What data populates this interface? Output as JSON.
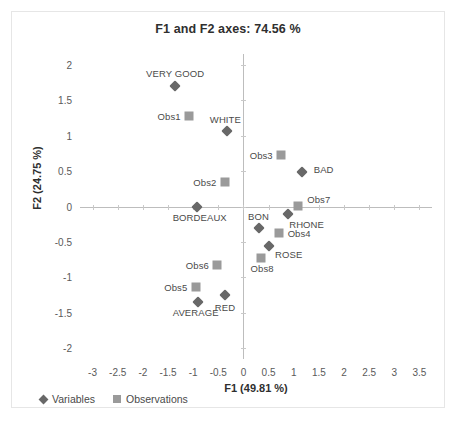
{
  "chart_data": {
    "type": "scatter",
    "title": "F1 and F2 axes: 74.56 %",
    "xlabel": "F1 (49.81 %)",
    "ylabel": "F2 (24.75 %)",
    "xlim": [
      -3.25,
      3.75
    ],
    "ylim": [
      -2.15,
      2.15
    ],
    "xticks": [
      "-3",
      "-2.5",
      "-2",
      "-1.5",
      "-1",
      "-0.5",
      "0",
      "0.5",
      "1",
      "1.5",
      "2",
      "2.5",
      "3",
      "3.5"
    ],
    "xtick_values": [
      -3,
      -2.5,
      -2,
      -1.5,
      -1,
      -0.5,
      0,
      0.5,
      1,
      1.5,
      2,
      2.5,
      3,
      3.5
    ],
    "yticks": [
      "2",
      "1.5",
      "1",
      "0.5",
      "0",
      "-0.5",
      "-1",
      "-1.5",
      "-2"
    ],
    "ytick_values": [
      2,
      1.5,
      1,
      0.5,
      0,
      -0.5,
      -1,
      -1.5,
      -2
    ],
    "grid": false,
    "legend_position": "bottom-left",
    "colors": {
      "variables": "#686868",
      "observations": "#9a9a9a",
      "axis": "#bdbdbd",
      "text": "#4a4a4a"
    },
    "series": [
      {
        "name": "Variables",
        "marker": "diamond",
        "color": "#686868",
        "points": [
          {
            "label": "VERY GOOD",
            "x": -1.36,
            "y": 1.7,
            "label_dx": 0,
            "label_dy": -12
          },
          {
            "label": "WHITE",
            "x": -0.32,
            "y": 1.07,
            "label_dx": -2,
            "label_dy": -11
          },
          {
            "label": "BORDEAUX",
            "x": -0.93,
            "y": 0.0,
            "label_dx": 3,
            "label_dy": 11
          },
          {
            "label": "BAD",
            "x": 1.16,
            "y": 0.48,
            "label_dx": 22,
            "label_dy": -3
          },
          {
            "label": "RHONE",
            "x": 0.88,
            "y": -0.1,
            "label_dx": 19,
            "label_dy": 11
          },
          {
            "label": "BON",
            "x": 0.3,
            "y": -0.3,
            "label_dx": 0,
            "label_dy": -11
          },
          {
            "label": "ROSE",
            "x": 0.5,
            "y": -0.55,
            "label_dx": 20,
            "label_dy": 9
          },
          {
            "label": "AVERAGE",
            "x": -0.91,
            "y": -1.34,
            "label_dx": -2,
            "label_dy": 11
          },
          {
            "label": "RED",
            "x": -0.37,
            "y": -1.25,
            "label_dx": 0,
            "label_dy": 12
          }
        ]
      },
      {
        "name": "Observations",
        "marker": "square",
        "color": "#9a9a9a",
        "points": [
          {
            "label": "Obs1",
            "x": -1.08,
            "y": 1.27,
            "label_dx": -20,
            "label_dy": 0
          },
          {
            "label": "Obs2",
            "x": -0.37,
            "y": 0.34,
            "label_dx": -20,
            "label_dy": 0
          },
          {
            "label": "Obs3",
            "x": 0.75,
            "y": 0.72,
            "label_dx": -20,
            "label_dy": 0
          },
          {
            "label": "Obs7",
            "x": 1.08,
            "y": 0.01,
            "label_dx": 21,
            "label_dy": -6
          },
          {
            "label": "Obs4",
            "x": 0.71,
            "y": -0.38,
            "label_dx": 20,
            "label_dy": 0
          },
          {
            "label": "Obs8",
            "x": 0.35,
            "y": -0.72,
            "label_dx": 1,
            "label_dy": 11
          },
          {
            "label": "Obs6",
            "x": -0.52,
            "y": -0.83,
            "label_dx": -20,
            "label_dy": 0
          },
          {
            "label": "Obs5",
            "x": -0.95,
            "y": -1.14,
            "label_dx": -20,
            "label_dy": 0
          }
        ]
      }
    ],
    "legend": [
      {
        "label": "Variables",
        "marker": "diamond"
      },
      {
        "label": "Observations",
        "marker": "square"
      }
    ]
  }
}
